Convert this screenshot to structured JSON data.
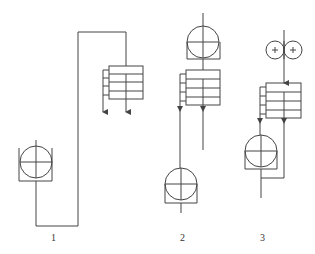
{
  "diagram": {
    "type": "winding-unit-schematics",
    "units": [
      {
        "label": "1",
        "components": [
          "lower roller with base",
          "multi-layer stack (4 rows)",
          "feed loop"
        ]
      },
      {
        "label": "2",
        "components": [
          "upper roller with base",
          "multi-layer stack (4 rows)",
          "lower roller with base"
        ]
      },
      {
        "label": "3",
        "components": [
          "twin small rollers",
          "multi-layer stack (4 rows)",
          "lower roller with base"
        ]
      }
    ],
    "colors": {
      "stroke": "#444444",
      "background": "#ffffff"
    }
  }
}
